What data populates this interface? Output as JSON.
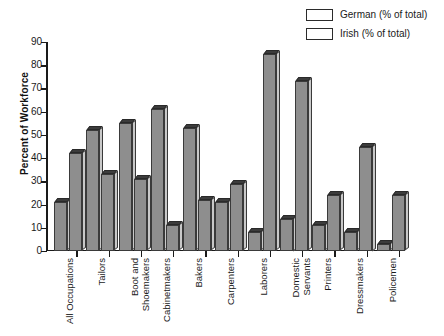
{
  "chart_data": {
    "type": "bar",
    "title": "",
    "xlabel": "",
    "ylabel": "Percent of Workforce",
    "ylim": [
      0,
      90
    ],
    "yticks": [
      0,
      10,
      20,
      30,
      40,
      50,
      60,
      70,
      80,
      90
    ],
    "grid": false,
    "legend_position": "top-right",
    "categories": [
      "All Occupations",
      "Tailors",
      "Boot and\nShoemakers",
      "Cabinetmakers",
      "Bakers",
      "Carpenters",
      "Laborers",
      "Domestic\nServants",
      "Printers",
      "Dressmakers",
      "Policemen"
    ],
    "series": [
      {
        "name": "German (% of total)",
        "color": "#8e8e8e",
        "values": [
          21,
          52,
          55,
          61,
          53,
          21,
          8,
          14,
          11,
          8,
          3
        ]
      },
      {
        "name": "Irish (% of total)",
        "color": "#8e8e8e",
        "values": [
          42,
          33,
          31,
          11,
          22,
          29,
          85,
          73,
          24,
          45,
          24
        ]
      }
    ]
  },
  "legend": {
    "items": [
      {
        "label": "German (% of total)",
        "swatch": "legend-swatch-german"
      },
      {
        "label": "Irish (% of total)",
        "swatch": "legend-swatch-irish"
      }
    ]
  },
  "axis": {
    "y_title": "Percent of Workforce"
  }
}
